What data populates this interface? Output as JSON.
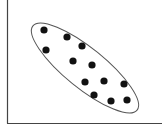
{
  "chart_data": {
    "type": "scatter",
    "title": "",
    "xlabel": "",
    "ylabel": "",
    "grid": false,
    "legend": null,
    "points_px": [
      {
        "x": 44,
        "y": 30
      },
      {
        "x": 67,
        "y": 37
      },
      {
        "x": 46,
        "y": 50
      },
      {
        "x": 82,
        "y": 46
      },
      {
        "x": 73,
        "y": 61
      },
      {
        "x": 92,
        "y": 65
      },
      {
        "x": 85,
        "y": 82
      },
      {
        "x": 104,
        "y": 81
      },
      {
        "x": 124,
        "y": 84
      },
      {
        "x": 94,
        "y": 95
      },
      {
        "x": 111,
        "y": 101
      },
      {
        "x": 127,
        "y": 100
      }
    ],
    "ellipse_px": {
      "cx": 85,
      "cy": 68,
      "rx": 67,
      "ry": 20,
      "rotation_deg": 39
    },
    "colors": {
      "points": "#111111",
      "ellipse": "#555555",
      "axes": "#444444"
    }
  }
}
